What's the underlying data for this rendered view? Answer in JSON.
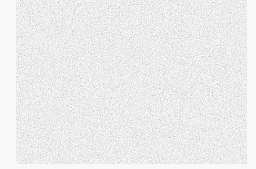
{
  "image": {
    "kind": "noise-texture",
    "width": 256,
    "height": 169,
    "background_color": "#f8f8f8",
    "noise_region": {
      "left": 16,
      "top": 0,
      "width": 231,
      "height": 164
    },
    "noise_colors": {
      "light": "#f5f5f5",
      "mid": "#b8b8b8",
      "dark": "#6e6e6e"
    }
  }
}
